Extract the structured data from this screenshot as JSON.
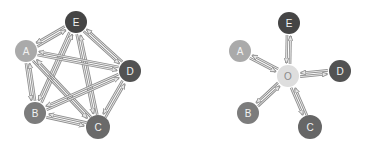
{
  "diagrams": [
    {
      "id": "full-mesh",
      "description": "Fully connected peer-to-peer network",
      "nodes": [
        {
          "id": "E",
          "label": "E",
          "x": 76,
          "y": 22,
          "r": 11,
          "color": "#454545"
        },
        {
          "id": "A",
          "label": "A",
          "x": 26,
          "y": 51,
          "r": 11,
          "color": "#aaaaaa"
        },
        {
          "id": "D",
          "label": "D",
          "x": 130,
          "y": 71,
          "r": 11,
          "color": "#525252"
        },
        {
          "id": "B",
          "label": "B",
          "x": 35,
          "y": 113,
          "r": 11,
          "color": "#7c7c7c"
        },
        {
          "id": "C",
          "label": "C",
          "x": 98,
          "y": 127,
          "r": 12,
          "color": "#6a6a6a"
        }
      ],
      "edges": [
        {
          "from": "E",
          "to": "A",
          "bidirectional": true
        },
        {
          "from": "E",
          "to": "D",
          "bidirectional": true
        },
        {
          "from": "E",
          "to": "B",
          "bidirectional": true
        },
        {
          "from": "E",
          "to": "C",
          "bidirectional": true
        },
        {
          "from": "A",
          "to": "D",
          "bidirectional": true
        },
        {
          "from": "A",
          "to": "B",
          "bidirectional": true
        },
        {
          "from": "A",
          "to": "C",
          "bidirectional": true
        },
        {
          "from": "D",
          "to": "B",
          "bidirectional": true
        },
        {
          "from": "D",
          "to": "C",
          "bidirectional": true
        },
        {
          "from": "B",
          "to": "C",
          "bidirectional": true
        }
      ]
    },
    {
      "id": "hub-star",
      "description": "Star network with central hub O",
      "nodes": [
        {
          "id": "E",
          "label": "E",
          "x": 289,
          "y": 23,
          "r": 11,
          "color": "#454545"
        },
        {
          "id": "A",
          "label": "A",
          "x": 240,
          "y": 51,
          "r": 11,
          "color": "#aaaaaa"
        },
        {
          "id": "O",
          "label": "O",
          "x": 288,
          "y": 76,
          "r": 11,
          "color": "#dedede",
          "dark_text": true
        },
        {
          "id": "D",
          "label": "D",
          "x": 340,
          "y": 71,
          "r": 11,
          "color": "#525252"
        },
        {
          "id": "B",
          "label": "B",
          "x": 248,
          "y": 113,
          "r": 11,
          "color": "#7c7c7c"
        },
        {
          "id": "C",
          "label": "C",
          "x": 310,
          "y": 127,
          "r": 12,
          "color": "#666666"
        }
      ],
      "edges": [
        {
          "from": "O",
          "to": "E",
          "bidirectional": true
        },
        {
          "from": "O",
          "to": "A",
          "bidirectional": true
        },
        {
          "from": "O",
          "to": "D",
          "bidirectional": true
        },
        {
          "from": "O",
          "to": "B",
          "bidirectional": true
        },
        {
          "from": "O",
          "to": "C",
          "bidirectional": true
        }
      ]
    }
  ],
  "style": {
    "arrow_stroke": "#8c8c8c",
    "arrow_fill": "#e6e6e6",
    "background": "#ffffff"
  }
}
